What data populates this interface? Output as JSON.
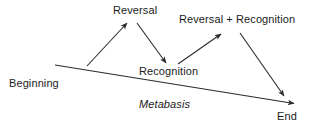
{
  "diagram": {
    "type": "narrative-structure-diagram",
    "colors": {
      "line": "#2b2b2b",
      "text": "#1b1b1b",
      "background": "#ffffff"
    },
    "labels": {
      "beginning": "Beginning",
      "reversal": "Reversal",
      "reversal_plus_recognition": "Reversal + Recognition",
      "recognition": "Recognition",
      "metabasis": "Metabasis",
      "end": "End"
    },
    "nodes": [
      {
        "id": "beginning",
        "text": "Beginning",
        "x": 9,
        "y": 77,
        "style": "normal"
      },
      {
        "id": "reversal",
        "text": "Reversal",
        "x": 113,
        "y": 4,
        "style": "normal"
      },
      {
        "id": "reversal-recognition",
        "text": "Reversal + Recognition",
        "x": 179,
        "y": 13,
        "style": "normal"
      },
      {
        "id": "recognition",
        "text": "Recognition",
        "x": 139,
        "y": 65,
        "style": "normal"
      },
      {
        "id": "metabasis",
        "text": "Metabasis",
        "x": 139,
        "y": 98,
        "style": "italic"
      },
      {
        "id": "end",
        "text": "End",
        "x": 277,
        "y": 110,
        "style": "normal"
      }
    ],
    "edges": [
      {
        "id": "baseline",
        "from": "beginning",
        "to": "end",
        "x1": 55,
        "y1": 65,
        "x2": 296,
        "y2": 104,
        "arrow": "end"
      },
      {
        "id": "rise-to-reversal",
        "from": "baseline",
        "to": "reversal",
        "x1": 87,
        "y1": 66,
        "x2": 128,
        "y2": 22,
        "arrow": "end"
      },
      {
        "id": "fall-to-recognition",
        "from": "reversal",
        "to": "recognition",
        "x1": 137,
        "y1": 23,
        "x2": 167,
        "y2": 64,
        "arrow": "end"
      },
      {
        "id": "rise-to-reversal-recognition",
        "from": "recognition",
        "to": "reversal-recognition",
        "x1": 178,
        "y1": 64,
        "x2": 222,
        "y2": 33,
        "arrow": "end"
      },
      {
        "id": "fall-to-end",
        "from": "reversal-recognition",
        "to": "end",
        "x1": 240,
        "y1": 33,
        "x2": 285,
        "y2": 97,
        "arrow": "end"
      }
    ]
  }
}
